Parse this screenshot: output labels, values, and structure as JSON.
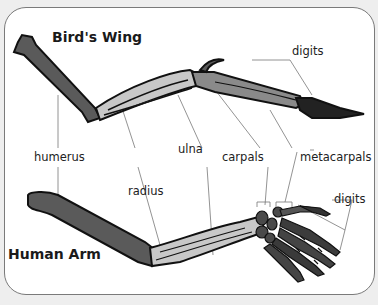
{
  "diagram": {
    "titles": {
      "bird": "Bird's Wing",
      "human": "Human Arm"
    },
    "labels": {
      "digits_top": "digits",
      "humerus": "humerus",
      "ulna": "ulna",
      "carpals": "carpals",
      "metacarpals": "metacarpals",
      "radius": "radius",
      "digits_bottom": "digits"
    },
    "colors": {
      "humerus": "#5a5a5a",
      "forearm": "#c8c8c8",
      "outline": "#111111",
      "hand": "#3a3a3a",
      "leader": "#777777",
      "panel_border": "#7a7a7a",
      "background": "#eeeeee"
    }
  }
}
